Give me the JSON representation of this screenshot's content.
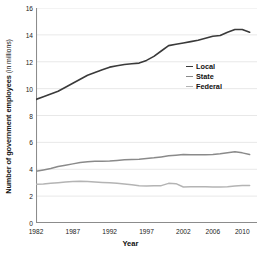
{
  "chart_data": {
    "type": "line",
    "title": "",
    "xlabel": "Year",
    "ylabel": "Number of government employees",
    "ylabel_unit": "(in millions)",
    "xlim": [
      1982,
      2012
    ],
    "ylim": [
      0,
      16
    ],
    "grid": "horizontal",
    "legend_position": "inside-right",
    "y_ticks": [
      "0",
      "2",
      "4",
      "6",
      "8",
      "10",
      "12",
      "14",
      "16"
    ],
    "y_tick_values": [
      0,
      2,
      4,
      6,
      8,
      10,
      12,
      14,
      16
    ],
    "x_tick_labels": [
      "1982",
      "1987",
      "1992",
      "1997",
      "2002",
      "2006",
      "2010"
    ],
    "x_tick_label_values": [
      1982,
      1987,
      1992,
      1997,
      2002,
      2006,
      2010
    ],
    "x_minor_tick_values": [
      1982,
      1983,
      1984,
      1985,
      1986,
      1987,
      1988,
      1989,
      1990,
      1991,
      1992,
      1993,
      1994,
      1995,
      1996,
      1997,
      1998,
      1999,
      2000,
      2001,
      2002,
      2003,
      2004,
      2005,
      2006,
      2007,
      2008,
      2009,
      2010,
      2011,
      2012
    ],
    "x": [
      1982,
      1983,
      1984,
      1985,
      1986,
      1987,
      1988,
      1989,
      1990,
      1991,
      1992,
      1993,
      1994,
      1995,
      1996,
      1997,
      1998,
      1999,
      2000,
      2001,
      2002,
      2003,
      2004,
      2005,
      2006,
      2007,
      2008,
      2009,
      2010,
      2011
    ],
    "series": [
      {
        "name": "Local",
        "color": "#3a3a3a",
        "values": [
          9.2,
          9.4,
          9.6,
          9.8,
          10.1,
          10.4,
          10.7,
          11.0,
          11.2,
          11.4,
          11.6,
          11.7,
          11.8,
          11.85,
          11.9,
          12.1,
          12.4,
          12.8,
          13.2,
          13.3,
          13.4,
          13.5,
          13.6,
          13.75,
          13.9,
          13.95,
          14.2,
          14.4,
          14.4,
          14.2
        ],
        "line_width": 1.6
      },
      {
        "name": "State",
        "color": "#8a8a8a",
        "values": [
          3.85,
          3.95,
          4.05,
          4.2,
          4.3,
          4.4,
          4.5,
          4.55,
          4.6,
          4.6,
          4.62,
          4.66,
          4.7,
          4.72,
          4.75,
          4.8,
          4.85,
          4.92,
          5.0,
          5.05,
          5.1,
          5.08,
          5.07,
          5.08,
          5.1,
          5.15,
          5.22,
          5.3,
          5.22,
          5.1
        ],
        "line_width": 1.5
      },
      {
        "name": "Federal",
        "color": "#b4b4b4",
        "values": [
          2.88,
          2.9,
          2.95,
          3.0,
          3.05,
          3.08,
          3.1,
          3.08,
          3.05,
          3.02,
          3.0,
          2.95,
          2.9,
          2.85,
          2.78,
          2.75,
          2.77,
          2.78,
          2.95,
          2.93,
          2.68,
          2.7,
          2.7,
          2.7,
          2.68,
          2.68,
          2.7,
          2.75,
          2.8,
          2.8
        ],
        "line_width": 1.5
      }
    ]
  },
  "legend": {
    "items": [
      {
        "label": "Local"
      },
      {
        "label": "State"
      },
      {
        "label": "Federal"
      }
    ]
  },
  "colors": {
    "axis": "#8c8c8c",
    "grid": "#e2e2e2",
    "text": "#1a1a1a",
    "background": "#ffffff"
  }
}
